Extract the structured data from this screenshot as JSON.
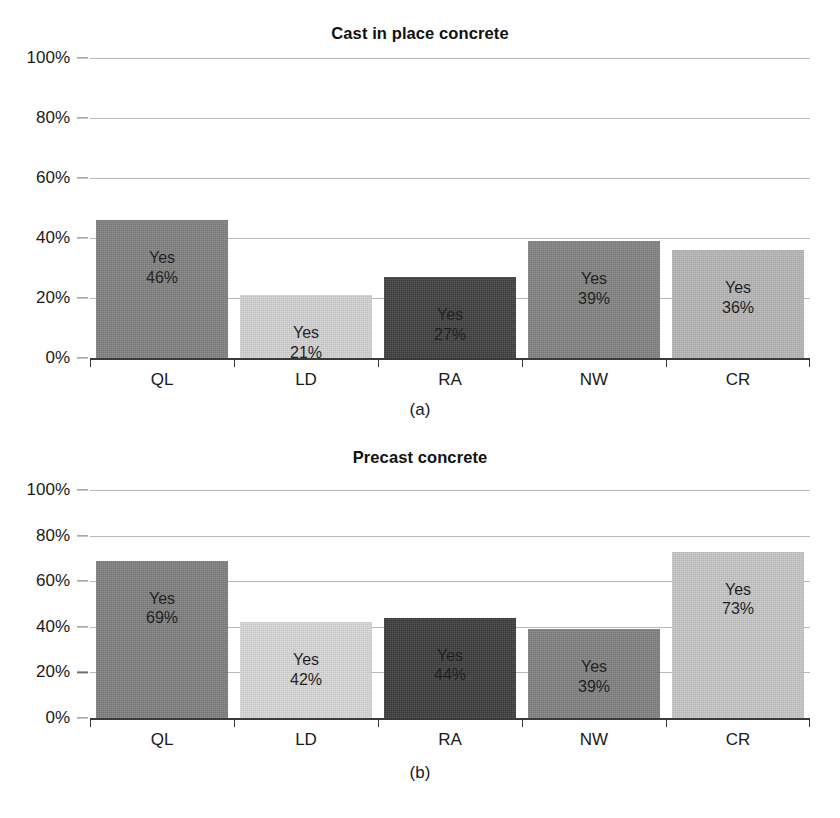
{
  "figure": {
    "background": "#ffffff",
    "axis_color": "#3a3a3a",
    "gridline_color": "#b9b9b9"
  },
  "chart_data": [
    {
      "type": "bar",
      "panel": "(a)",
      "title": "Cast in place concrete",
      "xlabel": "",
      "ylabel": "",
      "ylim": [
        0,
        100
      ],
      "yticks": [
        "0%",
        "20%",
        "40%",
        "60%",
        "80%",
        "100%"
      ],
      "ytick_values": [
        0,
        20,
        40,
        60,
        80,
        100
      ],
      "grid": true,
      "legend": "none",
      "categories": [
        "QL",
        "LD",
        "RA",
        "NW",
        "CR"
      ],
      "values": [
        46,
        21,
        27,
        39,
        36
      ],
      "bar_labels": [
        {
          "line1": "Yes",
          "line2": "46%"
        },
        {
          "line1": "Yes",
          "line2": "21%"
        },
        {
          "line1": "Yes",
          "line2": "27%"
        },
        {
          "line1": "Yes",
          "line2": "39%"
        },
        {
          "line1": "Yes",
          "line2": "36%"
        }
      ],
      "colors": [
        "#808080",
        "#d2d2d2",
        "#3f3f3f",
        "#828282",
        "#b6b6b6"
      ]
    },
    {
      "type": "bar",
      "panel": "(b)",
      "title": "Precast concrete",
      "xlabel": "",
      "ylabel": "",
      "ylim": [
        0,
        100
      ],
      "yticks": [
        "0%",
        "20%",
        "40%",
        "60%",
        "80%",
        "100%"
      ],
      "ytick_values": [
        0,
        20,
        40,
        60,
        80,
        100
      ],
      "grid": true,
      "legend": "none",
      "categories": [
        "QL",
        "LD",
        "RA",
        "NW",
        "CR"
      ],
      "values": [
        69,
        42,
        44,
        39,
        73
      ],
      "bar_labels": [
        {
          "line1": "Yes",
          "line2": "69%"
        },
        {
          "line1": "Yes",
          "line2": "42%"
        },
        {
          "line1": "Yes",
          "line2": "44%"
        },
        {
          "line1": "Yes",
          "line2": "39%"
        },
        {
          "line1": "Yes",
          "line2": "73%"
        }
      ],
      "colors": [
        "#7e7e7e",
        "#d7d7d7",
        "#3d3d3d",
        "#808080",
        "#c6c6c6"
      ]
    }
  ]
}
